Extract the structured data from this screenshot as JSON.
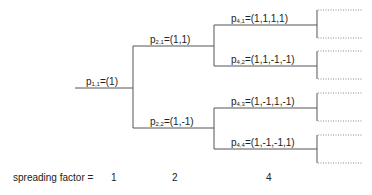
{
  "diagram": {
    "nodes": [
      {
        "id": "p11",
        "base": "p",
        "sub": "1,1",
        "value": "=(1)"
      },
      {
        "id": "p21",
        "base": "p",
        "sub": "2,1",
        "value": "=(1,1)"
      },
      {
        "id": "p22",
        "base": "p",
        "sub": "2,2",
        "value": "=(1,-1)"
      },
      {
        "id": "p41",
        "base": "p",
        "sub": "4,1",
        "value": "=(1,1,1,1)"
      },
      {
        "id": "p42",
        "base": "p",
        "sub": "4,2",
        "value": "=(1,1,-1,-1)"
      },
      {
        "id": "p43",
        "base": "p",
        "sub": "4,3",
        "value": "=(1,-1,1,-1)"
      },
      {
        "id": "p44",
        "base": "p",
        "sub": "4,4",
        "value": "=(1,-1,-1,1)"
      }
    ],
    "spreading_factor": {
      "label": "spreading factor =",
      "values": [
        "1",
        "2",
        "4"
      ]
    },
    "colors": {
      "line": "#555555",
      "dotted": "#888888",
      "text": "#222222"
    }
  }
}
